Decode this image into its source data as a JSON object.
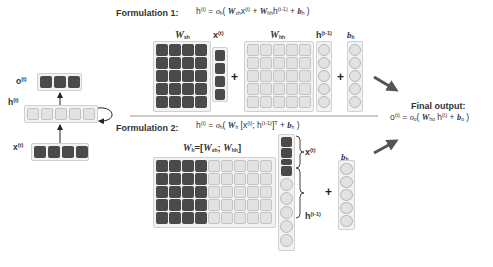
{
  "rnn": {
    "output_label": "o",
    "output_sup": "(t)",
    "hidden_label": "h",
    "hidden_sup": "(t)",
    "input_label": "x",
    "input_sup": "(t)",
    "output_units": 3,
    "hidden_units": 5,
    "input_units": 4
  },
  "formulation1": {
    "title": "Formulation 1:",
    "equation": "h(t) = σh( Wxh x(t) + Whh h(t-1) + bh )",
    "matrix_wxh_label": "W",
    "matrix_wxh_sub": "xh",
    "vector_x_label": "x",
    "vector_x_sup": "(t)",
    "matrix_whh_label": "W",
    "matrix_whh_sub": "hh",
    "vector_h_label": "h",
    "vector_h_sup": "(t-1)",
    "vector_b_label": "b",
    "vector_b_sub": "h",
    "plus": "+"
  },
  "formulation2": {
    "title": "Formulation 2:",
    "equation": "h(t) = σh( Wh [x(t); h(t-1)]T + bh )",
    "matrix_label": "Wh=[Wxh; Whh]",
    "brace_x_label": "x",
    "brace_x_sup": "(t)",
    "brace_h_label": "h",
    "brace_h_sup": "(t-1)",
    "vector_b_label": "b",
    "vector_b_sub": "h",
    "plus": "+"
  },
  "final_output": {
    "title": "Final output:",
    "equation": "o(t) = σo( Who h(t) + bo )"
  },
  "colors": {
    "dark_cell": "#4a4a4a",
    "light_cell": "#e2e2e2",
    "frame": "#f2f2f2",
    "arrow": "#555555"
  }
}
